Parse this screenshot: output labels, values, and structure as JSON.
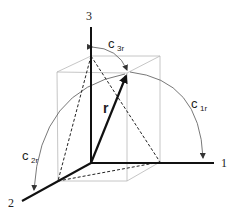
{
  "diagram": {
    "title": "",
    "axes": [
      {
        "id": "1",
        "label": "1"
      },
      {
        "id": "2",
        "label": "2"
      },
      {
        "id": "3",
        "label": "3"
      }
    ],
    "vector": {
      "label": "r"
    },
    "angles": [
      {
        "id": "c1r",
        "base": "c",
        "sub": "1r"
      },
      {
        "id": "c2r",
        "base": "c",
        "sub": "2r"
      },
      {
        "id": "c3r",
        "base": "c",
        "sub": "3r"
      }
    ],
    "colors": {
      "axis": "#111111",
      "box": "#b0b0b0",
      "dashed": "#222222",
      "arc": "#555555"
    }
  }
}
